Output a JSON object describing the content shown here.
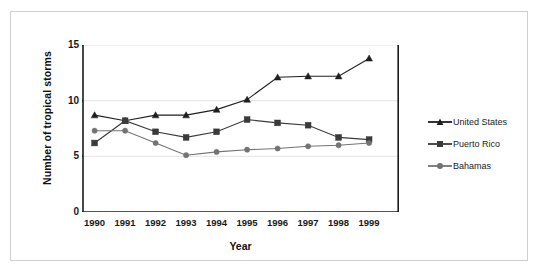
{
  "chart_data": {
    "type": "line",
    "title": "",
    "xlabel": "Year",
    "ylabel": "Number of tropical storms",
    "categories": [
      "1990",
      "1991",
      "1992",
      "1993",
      "1994",
      "1995",
      "1996",
      "1997",
      "1998",
      "1999"
    ],
    "x": [
      1990,
      1991,
      1992,
      1993,
      1994,
      1995,
      1996,
      1997,
      1998,
      1999
    ],
    "ylim": [
      0,
      15
    ],
    "yticks": [
      "0",
      "5",
      "10",
      "15"
    ],
    "ytick_values": [
      0,
      5,
      10,
      15
    ],
    "grid": "horizontal",
    "legend_position": "right",
    "series": [
      {
        "name": "United States",
        "marker": "triangle",
        "color": "#1f1f1f",
        "values": [
          8.7,
          8.2,
          8.7,
          8.7,
          9.2,
          10.1,
          12.1,
          12.2,
          12.2,
          13.8
        ]
      },
      {
        "name": "Puerto Rico",
        "marker": "square",
        "color": "#3a3a3a",
        "values": [
          6.2,
          8.2,
          7.2,
          6.7,
          7.2,
          8.3,
          8.0,
          7.8,
          6.7,
          6.5
        ]
      },
      {
        "name": "Bahamas",
        "marker": "circle",
        "color": "#737373",
        "values": [
          7.3,
          7.3,
          6.2,
          5.1,
          5.4,
          5.6,
          5.7,
          5.9,
          6.0,
          6.2
        ]
      }
    ]
  },
  "axis": {
    "y_title": "Number of tropical storms",
    "x_title": "Year"
  },
  "colors": {
    "frame": "#cfcfcf",
    "axis": "#1a1a1a",
    "grid": "#e3e3e3",
    "series_us": "#1f1f1f",
    "series_pr": "#3a3a3a",
    "series_bs": "#737373",
    "background": "#ffffff"
  }
}
